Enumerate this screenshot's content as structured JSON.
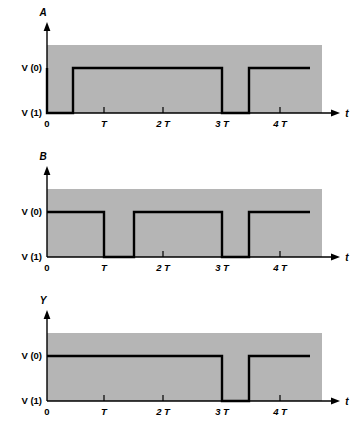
{
  "figure": {
    "type": "timing-diagram",
    "title": "",
    "background_color": "#ffffff",
    "plot_fill_color": "#b5b5b5",
    "trace_color": "#000000",
    "axis_color": "#000000"
  },
  "common": {
    "time_axis_label": "t",
    "level_high_label": "V (0)",
    "level_low_label": "V (1)",
    "tick_labels": [
      "0",
      "T",
      "2 T",
      "3 T",
      "4 T"
    ],
    "tick_times": [
      0,
      1,
      2,
      3,
      4
    ]
  },
  "chart_data": {
    "type": "line",
    "title": "",
    "xlabel": "t",
    "ylabel": "",
    "xlim": [
      0,
      4.6
    ],
    "ylim": [
      0,
      1
    ],
    "grid": false,
    "legend": "none",
    "x_tick_values": [
      0,
      1,
      2,
      3,
      4
    ],
    "x_tick_labels": [
      "0",
      "T",
      "2 T",
      "3 T",
      "4 T"
    ],
    "y_tick_labels": [
      "V (1)",
      "V (0)"
    ],
    "note": "Logic levels are inverted: V(0) is drawn above V(1). Y = NOR/AND style combination of A and B.",
    "series": [
      {
        "name": "A",
        "label": "A",
        "panel": 0,
        "points": [
          {
            "t": 0,
            "level": "V(1)"
          },
          {
            "t": 0.5,
            "level": "V(1)"
          },
          {
            "t": 0.5,
            "level": "V(0)"
          },
          {
            "t": 3.0,
            "level": "V(0)"
          },
          {
            "t": 3.0,
            "level": "V(1)"
          },
          {
            "t": 3.5,
            "level": "V(1)"
          },
          {
            "t": 3.5,
            "level": "V(0)"
          },
          {
            "t": 4.6,
            "level": "V(0)"
          }
        ],
        "transitions": [
          {
            "time": 0.5,
            "to": "V(0)"
          },
          {
            "time": 3.0,
            "to": "V(1)"
          },
          {
            "time": 3.5,
            "to": "V(0)"
          }
        ]
      },
      {
        "name": "B",
        "label": "B",
        "panel": 1,
        "points": [
          {
            "t": 0,
            "level": "V(0)"
          },
          {
            "t": 1.0,
            "level": "V(0)"
          },
          {
            "t": 1.0,
            "level": "V(1)"
          },
          {
            "t": 1.5,
            "level": "V(1)"
          },
          {
            "t": 1.5,
            "level": "V(0)"
          },
          {
            "t": 3.0,
            "level": "V(0)"
          },
          {
            "t": 3.0,
            "level": "V(1)"
          },
          {
            "t": 3.5,
            "level": "V(1)"
          },
          {
            "t": 3.5,
            "level": "V(0)"
          },
          {
            "t": 4.6,
            "level": "V(0)"
          }
        ],
        "transitions": [
          {
            "time": 1.0,
            "to": "V(1)"
          },
          {
            "time": 1.5,
            "to": "V(0)"
          },
          {
            "time": 3.0,
            "to": "V(1)"
          },
          {
            "time": 3.5,
            "to": "V(0)"
          }
        ]
      },
      {
        "name": "Y",
        "label": "Y",
        "panel": 2,
        "points": [
          {
            "t": 0,
            "level": "V(0)"
          },
          {
            "t": 3.0,
            "level": "V(0)"
          },
          {
            "t": 3.0,
            "level": "V(1)"
          },
          {
            "t": 3.5,
            "level": "V(1)"
          },
          {
            "t": 3.5,
            "level": "V(0)"
          },
          {
            "t": 4.6,
            "level": "V(0)"
          }
        ],
        "transitions": [
          {
            "time": 3.0,
            "to": "V(1)"
          },
          {
            "time": 3.5,
            "to": "V(0)"
          }
        ]
      }
    ]
  },
  "panels": [
    {
      "id": "panel-a",
      "signal_label": "A",
      "level_high_label": "V (0)",
      "level_low_label": "V (1)",
      "time_axis_label": "t",
      "tick_labels": [
        "0",
        "T",
        "2 T",
        "3 T",
        "4 T"
      ],
      "path": "M 47,68 L 47,113 L 73,113 L 73,68 L 222,68 L 222,113 L 249,113 L 249,68 L 310,68"
    },
    {
      "id": "panel-b",
      "signal_label": "B",
      "level_high_label": "V (0)",
      "level_low_label": "V (1)",
      "time_axis_label": "t",
      "tick_labels": [
        "0",
        "T",
        "2 T",
        "3 T",
        "4 T"
      ],
      "path": "M 47,68 L 104,68 L 104,113 L 134,113 L 134,68 L 222,68 L 222,113 L 249,113 L 249,68 L 310,68"
    },
    {
      "id": "panel-y",
      "signal_label": "Y",
      "level_high_label": "V (0)",
      "level_low_label": "V (1)",
      "time_axis_label": "t",
      "tick_labels": [
        "0",
        "T",
        "2 T",
        "3 T",
        "4 T"
      ],
      "path": "M 47,68 L 222,68 L 222,113 L 249,113 L 249,68 L 310,68"
    }
  ]
}
